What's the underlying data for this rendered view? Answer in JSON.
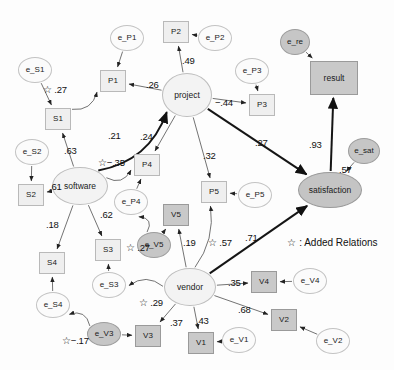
{
  "figure": {
    "type": "sem-path-diagram",
    "legend": "☆ : Added Relations",
    "legend_symbol": "☆",
    "legend_text": ": Added Relations"
  },
  "chart_data": {
    "type": "diagram",
    "title": "",
    "subtitle": "",
    "legend_position": "middle-right",
    "nodes": [
      {
        "id": "e_S1",
        "label": "e_S1",
        "shape": "ellipse",
        "kind": "error",
        "x": 35,
        "y": 70,
        "w": 34,
        "h": 26
      },
      {
        "id": "e_S2",
        "label": "e_S2",
        "shape": "ellipse",
        "kind": "error",
        "x": 32,
        "y": 152,
        "w": 34,
        "h": 26
      },
      {
        "id": "e_S3",
        "label": "e_S3",
        "shape": "ellipse",
        "kind": "error",
        "x": 109,
        "y": 285,
        "w": 34,
        "h": 26
      },
      {
        "id": "e_S4",
        "label": "e_S4",
        "shape": "ellipse",
        "kind": "error",
        "x": 53,
        "y": 305,
        "w": 34,
        "h": 26
      },
      {
        "id": "e_P1",
        "label": "e_P1",
        "shape": "ellipse",
        "kind": "error",
        "x": 127,
        "y": 38,
        "w": 34,
        "h": 26
      },
      {
        "id": "e_P2",
        "label": "e_P2",
        "shape": "ellipse",
        "kind": "error",
        "x": 215,
        "y": 38,
        "w": 34,
        "h": 26
      },
      {
        "id": "e_P3",
        "label": "e_P3",
        "shape": "ellipse",
        "kind": "error",
        "x": 252,
        "y": 71,
        "w": 34,
        "h": 26
      },
      {
        "id": "e_P4",
        "label": "e_P4",
        "shape": "ellipse",
        "kind": "error",
        "x": 131,
        "y": 202,
        "w": 34,
        "h": 26
      },
      {
        "id": "e_P5",
        "label": "e_P5",
        "shape": "ellipse",
        "kind": "error",
        "x": 255,
        "y": 195,
        "w": 34,
        "h": 26
      },
      {
        "id": "e_V1",
        "label": "e_V1",
        "shape": "ellipse",
        "kind": "error",
        "x": 239,
        "y": 340,
        "w": 34,
        "h": 26
      },
      {
        "id": "e_V2",
        "label": "e_V2",
        "shape": "ellipse",
        "kind": "error",
        "x": 333,
        "y": 341,
        "w": 34,
        "h": 26
      },
      {
        "id": "e_V3",
        "label": "e_V3",
        "shape": "ellipse",
        "kind": "error-shaded",
        "x": 104,
        "y": 334,
        "w": 34,
        "h": 24
      },
      {
        "id": "e_V4",
        "label": "e_V4",
        "shape": "ellipse",
        "kind": "error",
        "x": 310,
        "y": 281,
        "w": 34,
        "h": 26
      },
      {
        "id": "e_V5",
        "label": "e_V5",
        "shape": "ellipse",
        "kind": "error-shaded",
        "x": 154,
        "y": 245,
        "w": 34,
        "h": 26
      },
      {
        "id": "e_re",
        "label": "e_re",
        "shape": "ellipse",
        "kind": "error-shaded",
        "x": 295,
        "y": 42,
        "w": 30,
        "h": 26
      },
      {
        "id": "e_sat",
        "label": "e_sat",
        "shape": "ellipse",
        "kind": "error-shaded",
        "x": 364,
        "y": 151,
        "w": 32,
        "h": 26
      },
      {
        "id": "S1",
        "label": "S1",
        "shape": "rect",
        "kind": "indicator",
        "x": 58,
        "y": 119,
        "w": 26,
        "h": 22
      },
      {
        "id": "S2",
        "label": "S2",
        "shape": "rect",
        "kind": "indicator",
        "x": 31,
        "y": 195,
        "w": 26,
        "h": 22
      },
      {
        "id": "S3",
        "label": "S3",
        "shape": "rect",
        "kind": "indicator",
        "x": 108,
        "y": 250,
        "w": 26,
        "h": 22
      },
      {
        "id": "S4",
        "label": "S4",
        "shape": "rect",
        "kind": "indicator",
        "x": 52,
        "y": 263,
        "w": 26,
        "h": 22
      },
      {
        "id": "P1",
        "label": "P1",
        "shape": "rect",
        "kind": "indicator",
        "x": 113,
        "y": 81,
        "w": 26,
        "h": 22
      },
      {
        "id": "P2",
        "label": "P2",
        "shape": "rect",
        "kind": "indicator",
        "x": 176,
        "y": 32,
        "w": 26,
        "h": 22
      },
      {
        "id": "P3",
        "label": "P3",
        "shape": "rect",
        "kind": "indicator",
        "x": 262,
        "y": 105,
        "w": 26,
        "h": 22
      },
      {
        "id": "P4",
        "label": "P4",
        "shape": "rect",
        "kind": "indicator",
        "x": 147,
        "y": 165,
        "w": 26,
        "h": 22
      },
      {
        "id": "P5",
        "label": "P5",
        "shape": "rect",
        "kind": "indicator",
        "x": 214,
        "y": 192,
        "w": 26,
        "h": 22
      },
      {
        "id": "V1",
        "label": "V1",
        "shape": "rect",
        "kind": "indicator-shaded",
        "x": 201,
        "y": 343,
        "w": 26,
        "h": 22
      },
      {
        "id": "V2",
        "label": "V2",
        "shape": "rect",
        "kind": "indicator-shaded",
        "x": 284,
        "y": 320,
        "w": 26,
        "h": 22
      },
      {
        "id": "V3",
        "label": "V3",
        "shape": "rect",
        "kind": "indicator-shaded",
        "x": 148,
        "y": 336,
        "w": 26,
        "h": 22
      },
      {
        "id": "V4",
        "label": "V4",
        "shape": "rect",
        "kind": "indicator-shaded",
        "x": 264,
        "y": 282,
        "w": 26,
        "h": 22
      },
      {
        "id": "V5",
        "label": "V5",
        "shape": "rect",
        "kind": "indicator-shaded",
        "x": 176,
        "y": 215,
        "w": 26,
        "h": 22
      },
      {
        "id": "project",
        "label": "project",
        "shape": "ellipse",
        "kind": "latent",
        "x": 187,
        "y": 95,
        "w": 50,
        "h": 44
      },
      {
        "id": "software",
        "label": "software",
        "shape": "ellipse",
        "kind": "latent",
        "x": 80,
        "y": 186,
        "w": 56,
        "h": 38
      },
      {
        "id": "vendor",
        "label": "vendor",
        "shape": "ellipse",
        "kind": "latent-shaded",
        "x": 190,
        "y": 287,
        "w": 52,
        "h": 38
      },
      {
        "id": "satisfaction",
        "label": "satisfaction",
        "shape": "ellipse",
        "kind": "endogenous",
        "x": 330,
        "y": 190,
        "w": 64,
        "h": 36
      },
      {
        "id": "result",
        "label": "result",
        "shape": "rect",
        "kind": "outcome-shaded",
        "x": 334,
        "y": 78,
        "w": 48,
        "h": 34
      }
    ],
    "edges": [
      {
        "from": "e_S1",
        "to": "S1",
        "value": "",
        "style": "thin"
      },
      {
        "from": "e_S2",
        "to": "S2",
        "value": "",
        "style": "thin"
      },
      {
        "from": "e_S3",
        "to": "S3",
        "value": "",
        "style": "thin"
      },
      {
        "from": "e_S4",
        "to": "S4",
        "value": "",
        "style": "thin"
      },
      {
        "from": "e_P1",
        "to": "P1",
        "value": "",
        "style": "thin"
      },
      {
        "from": "e_P2",
        "to": "P2",
        "value": "",
        "style": "thin"
      },
      {
        "from": "e_P3",
        "to": "P3",
        "value": "",
        "style": "thin"
      },
      {
        "from": "e_P4",
        "to": "P4",
        "value": "",
        "style": "thin"
      },
      {
        "from": "e_P5",
        "to": "P5",
        "value": "",
        "style": "thin"
      },
      {
        "from": "e_V1",
        "to": "V1",
        "value": "",
        "style": "thin"
      },
      {
        "from": "e_V2",
        "to": "V2",
        "value": "",
        "style": "thin"
      },
      {
        "from": "e_V3",
        "to": "V3",
        "value": "",
        "style": "thin"
      },
      {
        "from": "e_V4",
        "to": "V4",
        "value": "",
        "style": "thin"
      },
      {
        "from": "e_V5",
        "to": "V5",
        "value": "",
        "style": "thin"
      },
      {
        "from": "e_re",
        "to": "result",
        "value": "",
        "style": "thin"
      },
      {
        "from": "e_sat",
        "to": "satisfaction",
        "value": ".57",
        "style": "thin"
      },
      {
        "from": "software",
        "to": "S1",
        "value": ".63",
        "style": "thin"
      },
      {
        "from": "software",
        "to": "S2",
        "value": ".61",
        "style": "thin"
      },
      {
        "from": "software",
        "to": "S3",
        "value": ".62",
        "style": "thin"
      },
      {
        "from": "software",
        "to": "S4",
        "value": ".18",
        "style": "thin"
      },
      {
        "from": "project",
        "to": "P1",
        "value": ".26",
        "style": "thin"
      },
      {
        "from": "project",
        "to": "P2",
        "value": ".49",
        "style": "thin"
      },
      {
        "from": "project",
        "to": "P3",
        "value": "−.44",
        "style": "thin"
      },
      {
        "from": "project",
        "to": "P4",
        "value": ".24",
        "style": "thin"
      },
      {
        "from": "project",
        "to": "P5",
        "value": ".32",
        "style": "thin"
      },
      {
        "from": "vendor",
        "to": "V5",
        "value": ".19",
        "style": "thin"
      },
      {
        "from": "vendor",
        "to": "V4",
        "value": ".35",
        "style": "thin"
      },
      {
        "from": "vendor",
        "to": "V2",
        "value": ".68",
        "style": "thin"
      },
      {
        "from": "vendor",
        "to": "V1",
        "value": ".43",
        "style": "thin"
      },
      {
        "from": "vendor",
        "to": "V3",
        "value": ".37",
        "style": "thin"
      },
      {
        "from": "project",
        "to": "satisfaction",
        "value": ".27",
        "style": "bold"
      },
      {
        "from": "vendor",
        "to": "satisfaction",
        "value": ".71",
        "style": "bold"
      },
      {
        "from": "satisfaction",
        "to": "result",
        "value": ".93",
        "style": "bold"
      },
      {
        "from": "software",
        "to": "project",
        "value": ".21",
        "style": "bold-curved",
        "added": false
      },
      {
        "from": "S1",
        "to": "P1",
        "value": "☆ .27",
        "style": "thin",
        "added": true
      },
      {
        "from": "software",
        "to": "P4",
        "value": "☆−.35",
        "style": "thin",
        "added": true
      },
      {
        "from": "e_V5",
        "to": "e_P4",
        "value": "☆ .27",
        "style": "thin",
        "added": true
      },
      {
        "from": "vendor",
        "to": "P5",
        "value": "☆ .57",
        "style": "thin",
        "added": true
      },
      {
        "from": "vendor",
        "to": "e_S3",
        "value": "☆ .29",
        "style": "thin",
        "added": true
      },
      {
        "from": "e_V3",
        "to": "e_S4",
        "value": "☆−.17",
        "style": "thin",
        "added": true
      }
    ],
    "edge_labels": [
      {
        "id": "lbl-star-27-s1p1",
        "text": "☆ .27",
        "x": 43,
        "y": 85
      },
      {
        "id": "lbl-26",
        "text": ".26",
        "x": 146,
        "y": 80
      },
      {
        "id": "lbl-49",
        "text": ".49",
        "x": 182,
        "y": 56
      },
      {
        "id": "lbl-44",
        "text": "−.44",
        "x": 215,
        "y": 98
      },
      {
        "id": "lbl-21",
        "text": ".21",
        "x": 108,
        "y": 131
      },
      {
        "id": "lbl-24",
        "text": ".24",
        "x": 140,
        "y": 132
      },
      {
        "id": "lbl-63",
        "text": ".63",
        "x": 64,
        "y": 146
      },
      {
        "id": "lbl-star-m35",
        "text": "☆−.35",
        "x": 98,
        "y": 158
      },
      {
        "id": "lbl-32",
        "text": ".32",
        "x": 203,
        "y": 151
      },
      {
        "id": "lbl-27-proj-sat",
        "text": ".27",
        "x": 255,
        "y": 138
      },
      {
        "id": "lbl-93",
        "text": ".93",
        "x": 309,
        "y": 140
      },
      {
        "id": "lbl-57-sat",
        "text": ".57",
        "x": 339,
        "y": 165
      },
      {
        "id": "lbl-61",
        "text": ".61",
        "x": 49,
        "y": 182
      },
      {
        "id": "lbl-18",
        "text": ".18",
        "x": 46,
        "y": 220
      },
      {
        "id": "lbl-62",
        "text": ".62",
        "x": 100,
        "y": 210
      },
      {
        "id": "lbl-star-27-v5p4",
        "text": "☆ .27",
        "x": 126,
        "y": 243
      },
      {
        "id": "lbl-19",
        "text": ".19",
        "x": 183,
        "y": 238
      },
      {
        "id": "lbl-star-57",
        "text": "☆ .57",
        "x": 208,
        "y": 238
      },
      {
        "id": "lbl-71",
        "text": ".71",
        "x": 245,
        "y": 233
      },
      {
        "id": "lbl-35",
        "text": ".35",
        "x": 228,
        "y": 278
      },
      {
        "id": "lbl-68",
        "text": ".68",
        "x": 238,
        "y": 305
      },
      {
        "id": "lbl-star-29",
        "text": "☆ .29",
        "x": 139,
        "y": 298
      },
      {
        "id": "lbl-37",
        "text": ".37",
        "x": 170,
        "y": 318
      },
      {
        "id": "lbl-43",
        "text": ".43",
        "x": 196,
        "y": 316
      },
      {
        "id": "lbl-star-m17",
        "text": "☆−.17",
        "x": 62,
        "y": 336
      }
    ],
    "legend_entry": {
      "symbol": "☆",
      "text": ": Added Relations",
      "x": 287,
      "y": 238
    }
  },
  "colors": {
    "ink": "#111111",
    "rect_fill": "#efefef",
    "rect_shaded_fill": "#c9c9c9",
    "ellipse_fill": "#fbfbfb",
    "ellipse_shaded_fill": "#c6c6c6",
    "latent_fill": "#f3f3f3",
    "endogenous_fill": "#c4c4c4",
    "stroke": "#555555",
    "background": "#fdfdfd"
  }
}
